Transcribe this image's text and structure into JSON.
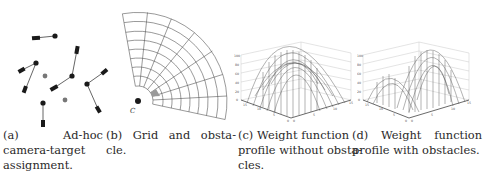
{
  "figure": {
    "subfigures": [
      {
        "id": "a",
        "caption_lines": [
          "(a)",
          "Ad-hoc",
          "camera-target",
          "assignment."
        ],
        "caption_full": "(a) Ad-hoc camera-target assignment.",
        "content": "cameras (dark rectangles) linked to black targets; grey dots unassigned"
      },
      {
        "id": "b",
        "caption_lines": [
          "(b)",
          "Grid",
          "and",
          "obsta-",
          "cle."
        ],
        "caption_full": "(b) Grid and obstacle.",
        "camera_label": "C",
        "content": "polar grid sector with shaded obstacle cell"
      },
      {
        "id": "c",
        "caption_lines": [
          "(c)",
          "Weight",
          "function",
          "profile without obsta-",
          "cles."
        ],
        "caption_full": "(c) Weight function profile without obstacles.",
        "z_ticks": [
          "0",
          "20",
          "40",
          "60",
          "80",
          "100"
        ],
        "x_ticks": [
          "0",
          "5",
          "10",
          "15"
        ],
        "y_ticks": [
          "0",
          "5",
          "10",
          "15"
        ]
      },
      {
        "id": "d",
        "caption_lines": [
          "(d)",
          "Weight",
          "function",
          "profile with obstacles."
        ],
        "caption_full": "(d) Weight function profile with obstacles.",
        "z_ticks": [
          "0",
          "20",
          "40",
          "60",
          "80",
          "100"
        ],
        "x_ticks": [
          "0",
          "5",
          "10",
          "15"
        ],
        "y_ticks": [
          "0",
          "5",
          "10",
          "15"
        ]
      }
    ],
    "colors": {
      "ink": "#222222",
      "target": "#1a1a1a",
      "unassigned": "#777777",
      "obstacle": "#9a9a9a",
      "mesh": "#555555"
    }
  }
}
